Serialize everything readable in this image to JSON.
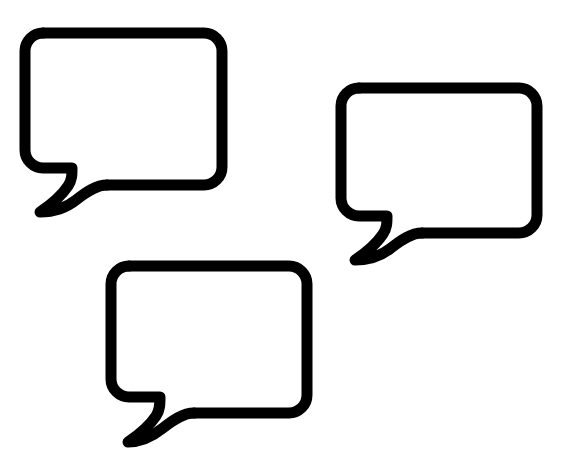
{
  "canvas": {
    "width": 564,
    "height": 476,
    "background_color": "#ffffff"
  },
  "artwork": {
    "title": "Speech Bubbles",
    "description": "Three outlined speech bubble icons",
    "stroke_color": "#000000",
    "fill_color": "none",
    "stroke_width": 11,
    "count": 3
  },
  "bubbles": [
    {
      "id": "bubble-1",
      "label": "Speech bubble 1",
      "position": "top-left",
      "x": 25,
      "y": 33,
      "width": 197,
      "height": 152,
      "corner_radius": 18,
      "tail_tip_x": 40,
      "tail_tip_y": 212,
      "body_path": "M43,33 L204,33 A18,18 0 0 1 222,51 L222,167 A18,18 0 0 1 204,185 L107,185",
      "tail_path": "M107,185 C96,185 86,192 76,200 C66,208 54,212 40,212 C52,204 62,195 68,186 C72,180 72,175 72,168 L43,168 A18,18 0 0 1 25,150 L25,51 A18,18 0 0 1 43,33"
    },
    {
      "id": "bubble-2",
      "label": "Speech bubble 2",
      "position": "middle-right",
      "x": 341,
      "y": 88,
      "width": 196,
      "height": 145,
      "corner_radius": 18,
      "tail_tip_x": 355,
      "tail_tip_y": 260,
      "body_path": "M359,88 L519,88 A18,18 0 0 1 537,106 L537,215 A18,18 0 0 1 519,233 L422,233",
      "tail_path": "M422,233 C411,233 401,240 391,248 C381,256 369,260 355,260 C367,252 377,243 383,234 C387,228 387,223 387,216 L359,216 A18,18 0 0 1 341,198 L341,106 A18,18 0 0 1 359,88"
    },
    {
      "id": "bubble-3",
      "label": "Speech bubble 3",
      "position": "bottom-center",
      "x": 111,
      "y": 266,
      "width": 196,
      "height": 147,
      "corner_radius": 18,
      "tail_tip_x": 128,
      "tail_tip_y": 442,
      "body_path": "M129,266 L289,266 A18,18 0 0 1 307,284 L307,395 A18,18 0 0 1 289,413 L194,413",
      "tail_path": "M194,413 C183,413 173,420 163,428 C153,436 142,442 128,442 C140,434 150,425 156,416 C160,410 160,404 160,397 L129,397 A18,18 0 0 1 111,379 L111,284 A18,18 0 0 1 129,266"
    }
  ]
}
